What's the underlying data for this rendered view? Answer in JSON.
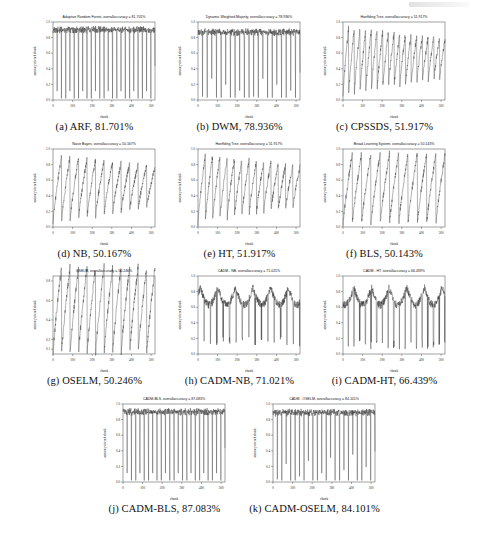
{
  "figure": {
    "axis": {
      "xlabel": "chunk",
      "ylabel": "accuracy of each chunk",
      "xticks": [
        "0",
        "100",
        "200",
        "300",
        "400",
        "500"
      ],
      "yticks_full": [
        "0.0",
        "0.2",
        "0.4",
        "0.6",
        "0.8",
        "1.0"
      ],
      "yticks_oselm": [
        "0.1",
        "0.2",
        "0.4",
        "0.6",
        "0.8"
      ]
    },
    "line_color": "#1f1f1f",
    "subfigures": [
      {
        "key": "a",
        "label": "(a)",
        "name": "ARF",
        "accuracy": "81.701%",
        "caption": "(a) ARF, 81.701%",
        "title": "Adaptive Random Forest, overallaccuracy = 81.701%",
        "pattern": "sawtooth-high",
        "periods": 24,
        "top": 0.93,
        "bottom": 0.02
      },
      {
        "key": "b",
        "label": "(b)",
        "name": "DWM",
        "accuracy": "78.936%",
        "caption": "(b) DWM, 78.936%",
        "title": "Dynamic Weighted Majority, overallaccuracy = 78.936%",
        "pattern": "sawtooth-high",
        "periods": 22,
        "top": 0.9,
        "bottom": 0.03
      },
      {
        "key": "c",
        "label": "(c)",
        "name": "CPSSDS",
        "accuracy": "51.917%",
        "caption": "(c) CPSSDS, 51.917%",
        "title": "Hoeffding Tree, overallaccuracy = 51.917%",
        "pattern": "ramp-decay",
        "periods": 18,
        "top": 0.95,
        "bottom": 0.05
      },
      {
        "key": "d",
        "label": "(d)",
        "name": "NB",
        "accuracy": "50.167%",
        "caption": "(d) NB, 50.167%",
        "title": "Naive Bayes, overallaccuracy = 50.167%",
        "pattern": "ramp-decay",
        "periods": 12,
        "top": 0.93,
        "bottom": 0.04
      },
      {
        "key": "e",
        "label": "(e)",
        "name": "HT",
        "accuracy": "51.917%",
        "caption": "(e) HT, 51.917%",
        "title": "Hoeffding Tree, overallaccuracy = 51.917%",
        "pattern": "ramp-decay",
        "periods": 14,
        "top": 0.94,
        "bottom": 0.04
      },
      {
        "key": "f",
        "label": "(f)",
        "name": "BLS",
        "accuracy": "50.143%",
        "caption": "(f) BLS, 50.143%",
        "title": "Broad Learning System, overallaccuracy = 50.143%",
        "pattern": "ramp",
        "periods": 11,
        "top": 0.95,
        "bottom": 0.03
      },
      {
        "key": "g",
        "label": "(g)",
        "name": "OSELM",
        "accuracy": "50.246%",
        "caption": "(g) OSELM, 50.246%",
        "title": "OSELM, overallaccuracy = 50.246%",
        "pattern": "ramp",
        "periods": 12,
        "top": 0.95,
        "bottom": 0.05
      },
      {
        "key": "h",
        "label": "(h)",
        "name": "CADM-NB",
        "accuracy": "71.021%",
        "caption": "(h) CADM-NB, 71.021%",
        "title": "CADM - NB, overallaccuracy = 71.021%",
        "pattern": "noisy-spikes",
        "periods": 16,
        "top": 0.9,
        "bottom": 0.1
      },
      {
        "key": "i",
        "label": "(i)",
        "name": "CADM-HT",
        "accuracy": "66.439%",
        "caption": "(i) CADM-HT, 66.439%",
        "title": "CADM - HT, overallaccuracy = 66.439%",
        "pattern": "noisy-spikes",
        "periods": 18,
        "top": 0.9,
        "bottom": 0.06
      },
      {
        "key": "j",
        "label": "(j)",
        "name": "CADM-BLS",
        "accuracy": "87.083%",
        "caption": "(j) CADM-BLS, 87.083%",
        "title": "CADM-BLS, overallaccuracy = 87.083%",
        "pattern": "sawtooth-high",
        "periods": 24,
        "top": 0.93,
        "bottom": 0.02
      },
      {
        "key": "k",
        "label": "(k)",
        "name": "CADM-OSELM",
        "accuracy": "84.101%",
        "caption": "(k) CADM-OSELM, 84.101%",
        "title": "CADM - OSELM, overallaccuracy = 84.101%",
        "pattern": "sawtooth-high",
        "periods": 23,
        "top": 0.92,
        "bottom": 0.02
      }
    ]
  },
  "chart_data": {
    "type": "line",
    "xlabel": "chunk",
    "ylabel": "accuracy of each chunk",
    "xlim": [
      0,
      520
    ],
    "ylim": [
      0,
      1
    ],
    "xticks": [
      0,
      100,
      200,
      300,
      400,
      500
    ],
    "yticks": [
      0.0,
      0.2,
      0.4,
      0.6,
      0.8,
      1.0
    ],
    "grid": false,
    "legend": "none",
    "panels": [
      {
        "panel": "a",
        "series_name": "Adaptive Random Forest",
        "short": "ARF",
        "overall_accuracy": 81.701,
        "shape": "periodic sawtooth, peaks ~0.90-0.95, sharp drops to ~0.02, ~24 cycles"
      },
      {
        "panel": "b",
        "series_name": "Dynamic Weighted Majority",
        "short": "DWM",
        "overall_accuracy": 78.936,
        "shape": "periodic sawtooth, peaks ~0.85-0.95, drops to ~0.03, ~22 cycles"
      },
      {
        "panel": "c",
        "series_name": "Hoeffding Tree (CPSSDS)",
        "short": "CPSSDS",
        "overall_accuracy": 51.917,
        "shape": "rising ramps with decaying amplitude, early peaks ~0.95 falling to ~0.6"
      },
      {
        "panel": "d",
        "series_name": "Naive Bayes",
        "short": "NB",
        "overall_accuracy": 50.167,
        "shape": "rising ramps, peaks ~0.9 decaying to ~0.55, troughs ~0.05-0.3"
      },
      {
        "panel": "e",
        "series_name": "Hoeffding Tree",
        "short": "HT",
        "overall_accuracy": 51.917,
        "shape": "rising ramps with decaying amplitude"
      },
      {
        "panel": "f",
        "series_name": "Broad Learning System",
        "short": "BLS",
        "overall_accuracy": 50.143,
        "shape": "rising ramps, full-range 0.03 to 0.95, ~11 cycles"
      },
      {
        "panel": "g",
        "series_name": "OSELM",
        "short": "OSELM",
        "overall_accuracy": 50.246,
        "shape": "rising ramps, range ~0.05 to 0.8, ~12 cycles"
      },
      {
        "panel": "h",
        "series_name": "CADM - NB",
        "short": "CADM-NB",
        "overall_accuracy": 71.021,
        "shape": "mostly high ~0.7-0.9 with noisy plateaus and intermittent deep spikes to ~0.1"
      },
      {
        "panel": "i",
        "series_name": "CADM - HT",
        "short": "CADM-HT",
        "overall_accuracy": 66.439,
        "shape": "high noisy plateaus ~0.6-0.9 with frequent deep spikes to ~0.05"
      },
      {
        "panel": "j",
        "series_name": "CADM-BLS",
        "short": "CADM-BLS",
        "overall_accuracy": 87.083,
        "shape": "high plateau ~0.9 with regular narrow drops to ~0.02, ~24 cycles"
      },
      {
        "panel": "k",
        "series_name": "CADM - OSELM",
        "short": "CADM-OSELM",
        "overall_accuracy": 84.101,
        "shape": "high plateau ~0.88 with regular narrow drops to ~0.02, ~23 cycles"
      }
    ]
  }
}
